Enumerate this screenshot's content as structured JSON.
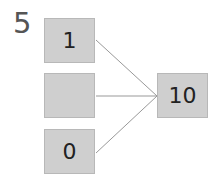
{
  "diagram": {
    "label": "5",
    "inputs": [
      {
        "value": "1"
      },
      {
        "value": ""
      },
      {
        "value": "0"
      }
    ],
    "output": {
      "value": "10"
    },
    "colors": {
      "box_fill": "#cfcfcf",
      "line": "#999999",
      "text": "#222222"
    }
  }
}
